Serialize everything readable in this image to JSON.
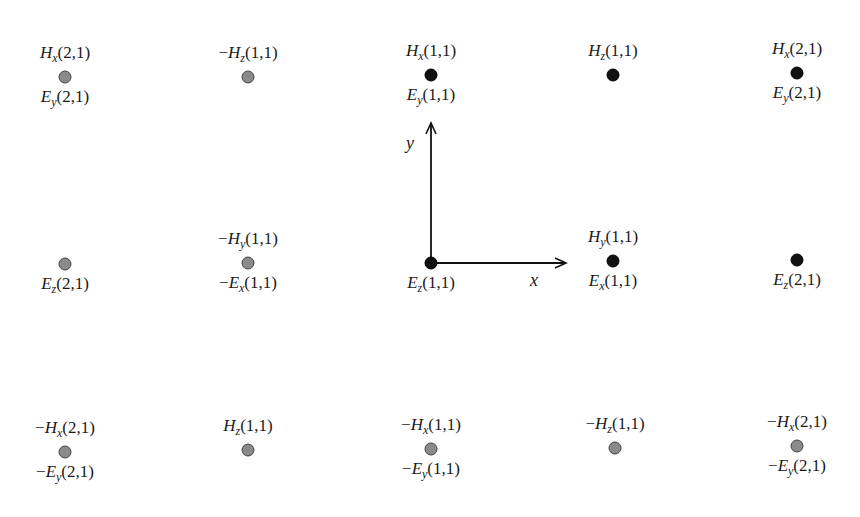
{
  "diagram": {
    "axes": {
      "x_label": "x",
      "y_label": "y"
    },
    "nodes": [
      {
        "id": "r0c0",
        "x": 65,
        "y": 77,
        "style": "gray",
        "above": {
          "sign": "",
          "f": "H",
          "s": "x",
          "idx": "(2,1)"
        },
        "below": {
          "sign": "",
          "f": "E",
          "s": "y",
          "idx": "(2,1)"
        }
      },
      {
        "id": "r0c1",
        "x": 248,
        "y": 77,
        "style": "gray",
        "above": {
          "sign": "−",
          "f": "H",
          "s": "z",
          "idx": "(1,1)"
        },
        "below": null
      },
      {
        "id": "r0c2",
        "x": 431,
        "y": 75,
        "style": "black",
        "above": {
          "sign": "",
          "f": "H",
          "s": "x",
          "idx": "(1,1)"
        },
        "below": {
          "sign": "",
          "f": "E",
          "s": "y",
          "idx": "(1,1)"
        }
      },
      {
        "id": "r0c3",
        "x": 613,
        "y": 75,
        "style": "black",
        "above": {
          "sign": "",
          "f": "H",
          "s": "z",
          "idx": "(1,1)"
        },
        "below": null
      },
      {
        "id": "r0c4",
        "x": 797,
        "y": 73,
        "style": "black",
        "above": {
          "sign": "",
          "f": "H",
          "s": "x",
          "idx": "(2,1)"
        },
        "below": {
          "sign": "",
          "f": "E",
          "s": "y",
          "idx": "(2,1)"
        }
      },
      {
        "id": "r1c0",
        "x": 65,
        "y": 264,
        "style": "gray",
        "above": null,
        "below": {
          "sign": "",
          "f": "E",
          "s": "z",
          "idx": "(2,1)"
        }
      },
      {
        "id": "r1c1",
        "x": 248,
        "y": 263,
        "style": "gray",
        "above": {
          "sign": "−",
          "f": "H",
          "s": "y",
          "idx": "(1,1)"
        },
        "below": {
          "sign": "−",
          "f": "E",
          "s": "x",
          "idx": "(1,1)"
        }
      },
      {
        "id": "r1c2",
        "x": 431,
        "y": 263,
        "style": "black",
        "above": null,
        "below": {
          "sign": "",
          "f": "E",
          "s": "z",
          "idx": "(1,1)"
        }
      },
      {
        "id": "r1c3",
        "x": 613,
        "y": 261,
        "style": "black",
        "above": {
          "sign": "",
          "f": "H",
          "s": "y",
          "idx": "(1,1)"
        },
        "below": {
          "sign": "",
          "f": "E",
          "s": "x",
          "idx": "(1,1)"
        }
      },
      {
        "id": "r1c4",
        "x": 797,
        "y": 260,
        "style": "black",
        "above": null,
        "below": {
          "sign": "",
          "f": "E",
          "s": "z",
          "idx": "(2,1)"
        }
      },
      {
        "id": "r2c0",
        "x": 65,
        "y": 452,
        "style": "gray",
        "above": {
          "sign": "−",
          "f": "H",
          "s": "x",
          "idx": "(2,1)"
        },
        "below": {
          "sign": "−",
          "f": "E",
          "s": "y",
          "idx": "(2,1)"
        }
      },
      {
        "id": "r2c1",
        "x": 248,
        "y": 450,
        "style": "gray",
        "above": {
          "sign": "",
          "f": "H",
          "s": "z",
          "idx": "(1,1)"
        },
        "below": null
      },
      {
        "id": "r2c2",
        "x": 431,
        "y": 449,
        "style": "gray",
        "above": {
          "sign": "−",
          "f": "H",
          "s": "x",
          "idx": "(1,1)"
        },
        "below": {
          "sign": "−",
          "f": "E",
          "s": "y",
          "idx": "(1,1)"
        }
      },
      {
        "id": "r2c3",
        "x": 615,
        "y": 448,
        "style": "gray",
        "above": {
          "sign": "−",
          "f": "H",
          "s": "z",
          "idx": "(1,1)"
        },
        "below": null
      },
      {
        "id": "r2c4",
        "x": 797,
        "y": 446,
        "style": "gray",
        "above": {
          "sign": "−",
          "f": "H",
          "s": "x",
          "idx": "(2,1)"
        },
        "below": {
          "sign": "−",
          "f": "E",
          "s": "y",
          "idx": "(2,1)"
        }
      }
    ]
  }
}
